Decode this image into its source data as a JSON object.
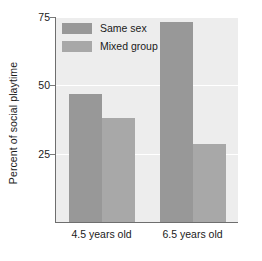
{
  "chart_data": {
    "type": "bar",
    "title": "",
    "xlabel": "",
    "ylabel": "Percent of social playtime",
    "categories": [
      "4.5 years old",
      "6.5 years old"
    ],
    "series": [
      {
        "name": "Same sex",
        "values": [
          47,
          73
        ],
        "color": "#989898"
      },
      {
        "name": "Mixed group",
        "values": [
          38,
          28.5
        ],
        "color": "#a8a8a8"
      }
    ],
    "ylim": [
      0,
      75
    ],
    "yticks": [
      25,
      50,
      75
    ],
    "ytick_labels": [
      "25",
      "50",
      "75"
    ],
    "grid": true,
    "legend_position": "top-left-inside",
    "plot_background": "#ededed",
    "gridline_color": "#ffffff",
    "axis_color": "#6e6e6e",
    "text_color": "#1a1a1a"
  },
  "axis": {
    "y_title": "Percent of social playtime",
    "ticks": [
      {
        "label": "75",
        "value": 75
      },
      {
        "label": "50",
        "value": 50
      },
      {
        "label": "25",
        "value": 25
      }
    ]
  },
  "legend": {
    "items": [
      {
        "label": "Same sex",
        "color": "#989898"
      },
      {
        "label": "Mixed group",
        "color": "#a8a8a8"
      }
    ]
  },
  "categories": [
    {
      "label": "4.5 years old"
    },
    {
      "label": "6.5 years old"
    }
  ]
}
